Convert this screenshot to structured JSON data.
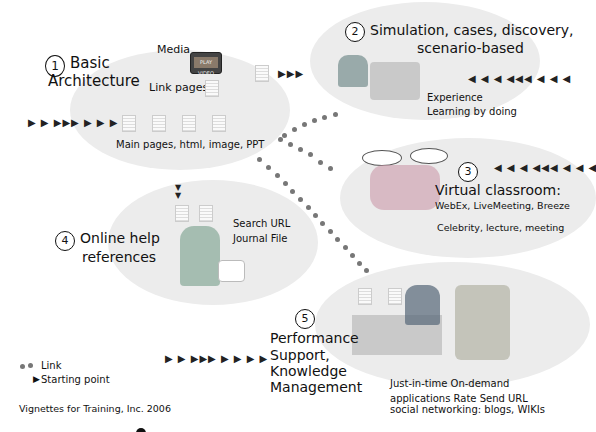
{
  "section1": {
    "number": "1",
    "title_line1": "Basic",
    "title_line2": "Architecture",
    "media_label": "Media",
    "tv_label": "PLAY VIDEO",
    "link_pages_label": "Link pages",
    "main_pages_label": "Main pages, html,  image, PPT"
  },
  "section2": {
    "number": "2",
    "title_line1": "Simulation, cases, discovery,",
    "title_line2": "scenario-based",
    "desc_line1": "Experience",
    "desc_line2": "Learning by doing"
  },
  "section3": {
    "number": "3",
    "title": "Virtual classroom:",
    "desc_line1": "WebEx, LiveMeeting, Breeze",
    "desc_line2": "Celebrity, lecture, meeting"
  },
  "section4": {
    "number": "4",
    "title_line1": "Online help",
    "title_line2": "references",
    "desc_line1": "Search URL",
    "desc_line2": "Journal  File"
  },
  "section5": {
    "number": "5",
    "title_line1": "Performance",
    "title_line2": "Support,",
    "title_line3": "Knowledge",
    "title_line4": "Management",
    "desc_line1": "Just-in-time On-demand",
    "desc_line2": "applications Rate  Send URL",
    "desc_line3": "social networking: blogs, WIKIs"
  },
  "legend": {
    "link_label": "Link",
    "start_label": "Starting point"
  },
  "footer": {
    "credit": "Vignettes for Training, Inc. 2006"
  },
  "arrows": {
    "right9": "▶ ▶ ▶▶▶ ▶ ▶ ▶ ▶",
    "left9": "◀ ◀ ◀ ◀◀◀ ◀ ◀ ◀",
    "right3": "▶▶▶",
    "down2": "▼"
  },
  "colors": {
    "ellipse": "#ececec",
    "dot": "#777777",
    "text": "#111111"
  }
}
